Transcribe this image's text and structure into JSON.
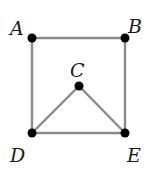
{
  "diagram": {
    "type": "graph",
    "nodes": [
      {
        "id": "A",
        "label": "A",
        "x": 32,
        "y": 38,
        "label_x": 10,
        "label_y": 35
      },
      {
        "id": "B",
        "label": "B",
        "x": 125,
        "y": 38,
        "label_x": 128,
        "label_y": 33
      },
      {
        "id": "C",
        "label": "C",
        "x": 79,
        "y": 86,
        "label_x": 70,
        "label_y": 77
      },
      {
        "id": "D",
        "label": "D",
        "x": 32,
        "y": 133,
        "label_x": 10,
        "label_y": 162
      },
      {
        "id": "E",
        "label": "E",
        "x": 125,
        "y": 133,
        "label_x": 127,
        "label_y": 162
      }
    ],
    "edges": [
      [
        "A",
        "B"
      ],
      [
        "A",
        "D"
      ],
      [
        "B",
        "E"
      ],
      [
        "D",
        "E"
      ],
      [
        "C",
        "D"
      ],
      [
        "C",
        "E"
      ]
    ],
    "edge_color": "#8a8a8a",
    "node_color": "#000000"
  }
}
